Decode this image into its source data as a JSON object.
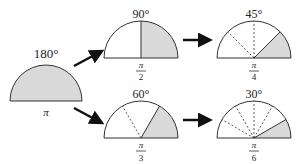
{
  "diagram": {
    "colors": {
      "fill": "#d9d9d9",
      "stroke": "#333333",
      "arrow": "#111111"
    },
    "start": {
      "angle_label": "180°",
      "radian_label": "π"
    },
    "top_middle": {
      "angle_label": "90°",
      "radian_num": "π",
      "radian_den": "2"
    },
    "top_right": {
      "angle_label": "45°",
      "radian_num": "π",
      "radian_den": "4"
    },
    "bottom_middle": {
      "angle_label": "60°",
      "radian_num": "π",
      "radian_den": "3"
    },
    "bottom_right": {
      "angle_label": "30°",
      "radian_num": "π",
      "radian_den": "6"
    }
  }
}
